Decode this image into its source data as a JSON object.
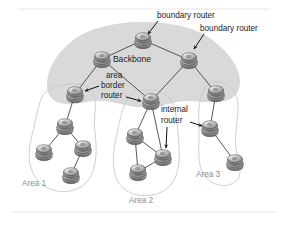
{
  "figure": {
    "background_color": "#ffffff",
    "backbone_color": "#d9d9d9",
    "area_outline_color": "#c9c9c9",
    "link_color": "#3a3a3a",
    "label_color": "#1b1b1b",
    "area_label_color": "#8d8d8d"
  },
  "labels": {
    "backbone": "Backbone",
    "boundary_router_1": "boundary router",
    "boundary_router_2": "boundary router",
    "area_border_router_line1": "area",
    "area_border_router_line2": "border",
    "area_border_router_line3": "router",
    "internal_router_line1": "internal",
    "internal_router_line2": "router",
    "area_1": "Area 1",
    "area_2": "Area 2",
    "area_3": "Area 3"
  },
  "nodes": [
    {
      "id": "bb-top",
      "name": "backbone-router-top",
      "x": 143,
      "y": 40,
      "group": "backbone"
    },
    {
      "id": "bb-left",
      "name": "backbone-router-left",
      "x": 102,
      "y": 59,
      "group": "backbone"
    },
    {
      "id": "bb-right",
      "name": "backbone-router-right",
      "x": 189,
      "y": 60,
      "group": "backbone"
    },
    {
      "id": "abr-1",
      "name": "area-border-router-area1",
      "x": 75,
      "y": 94,
      "group": "backbone"
    },
    {
      "id": "abr-2",
      "name": "area-border-router-area2",
      "x": 151,
      "y": 101,
      "group": "backbone"
    },
    {
      "id": "abr-3",
      "name": "area-border-router-area3",
      "x": 216,
      "y": 93,
      "group": "backbone"
    },
    {
      "id": "a1-n1",
      "name": "area1-router-upper",
      "x": 65,
      "y": 126,
      "group": "area1"
    },
    {
      "id": "a1-n2",
      "name": "area1-router-left",
      "x": 44,
      "y": 152,
      "group": "area1"
    },
    {
      "id": "a1-n3",
      "name": "area1-router-right",
      "x": 83,
      "y": 148,
      "group": "area1"
    },
    {
      "id": "a1-n4",
      "name": "area1-router-bottom",
      "x": 71,
      "y": 175,
      "group": "area1"
    },
    {
      "id": "a2-n1",
      "name": "area2-router-left",
      "x": 135,
      "y": 136,
      "group": "area2"
    },
    {
      "id": "a2-n2",
      "name": "area2-internal-router",
      "x": 163,
      "y": 157,
      "group": "area2"
    },
    {
      "id": "a2-n3",
      "name": "area2-router-bottom",
      "x": 138,
      "y": 172,
      "group": "area2"
    },
    {
      "id": "a3-n1",
      "name": "area3-internal-router",
      "x": 210,
      "y": 128,
      "group": "area3"
    },
    {
      "id": "a3-n2",
      "name": "area3-router-bottom",
      "x": 235,
      "y": 162,
      "group": "area3"
    }
  ],
  "links": [
    {
      "from": "bb-top",
      "to": "bb-left"
    },
    {
      "from": "bb-top",
      "to": "bb-right"
    },
    {
      "from": "bb-left",
      "to": "abr-1"
    },
    {
      "from": "bb-left",
      "to": "abr-2"
    },
    {
      "from": "bb-right",
      "to": "abr-2"
    },
    {
      "from": "bb-right",
      "to": "abr-3"
    },
    {
      "from": "abr-1",
      "to": "a1-n1"
    },
    {
      "from": "a1-n1",
      "to": "a1-n2"
    },
    {
      "from": "a1-n1",
      "to": "a1-n3"
    },
    {
      "from": "a1-n3",
      "to": "a1-n4"
    },
    {
      "from": "abr-2",
      "to": "a2-n1"
    },
    {
      "from": "abr-2",
      "to": "a2-n2"
    },
    {
      "from": "a2-n1",
      "to": "a2-n2"
    },
    {
      "from": "a2-n1",
      "to": "a2-n3"
    },
    {
      "from": "a2-n3",
      "to": "a2-n2"
    },
    {
      "from": "abr-3",
      "to": "a3-n1"
    },
    {
      "from": "a3-n1",
      "to": "a3-n2"
    }
  ],
  "areas": [
    {
      "id": "area1",
      "label": "Area 1",
      "label_x": 22,
      "label_y": 186
    },
    {
      "id": "area2",
      "label": "Area 2",
      "label_x": 129,
      "label_y": 203
    },
    {
      "id": "area3",
      "label": "Area 3",
      "label_x": 196,
      "label_y": 177
    }
  ]
}
